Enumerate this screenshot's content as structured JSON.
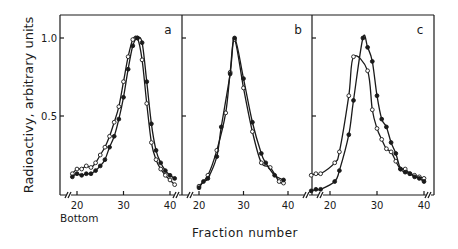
{
  "chart_data": {
    "type": "line",
    "title": "",
    "ylabel": "Radioactivy, arbitrary units",
    "xlabel": "Fraction number",
    "x_note": "Bottom",
    "ylim": [
      0,
      1.1
    ],
    "yticks": [
      0.5,
      1.0
    ],
    "ytick_labels": [
      "0.5",
      "1.0"
    ],
    "grid": false,
    "legend": "none",
    "panels": [
      {
        "label": "a",
        "xlim": [
          17,
          42
        ],
        "xticks": [
          20,
          30,
          40
        ],
        "xtick_labels": [
          "20",
          "30",
          "40"
        ],
        "series": [
          {
            "name": "open circles",
            "marker": "open-circle",
            "x": [
              19,
              20,
              21,
              22,
              23,
              24,
              25,
              26,
              27,
              28,
              29,
              30,
              31,
              32,
              33,
              34,
              35,
              36,
              37,
              38,
              39,
              40,
              41
            ],
            "y": [
              0.13,
              0.16,
              0.16,
              0.18,
              0.17,
              0.2,
              0.25,
              0.3,
              0.37,
              0.46,
              0.56,
              0.72,
              0.88,
              0.99,
              1.0,
              0.86,
              0.58,
              0.33,
              0.22,
              0.16,
              0.12,
              0.09,
              0.06
            ]
          },
          {
            "name": "filled circles",
            "marker": "filled-circle",
            "x": [
              19,
              20,
              21,
              22,
              23,
              24,
              25,
              26,
              27,
              28,
              29,
              30,
              31,
              32,
              33,
              34,
              35,
              36,
              37,
              38,
              39,
              40,
              41
            ],
            "y": [
              0.11,
              0.13,
              0.12,
              0.13,
              0.13,
              0.15,
              0.18,
              0.22,
              0.3,
              0.37,
              0.48,
              0.62,
              0.8,
              0.95,
              1.0,
              0.97,
              0.72,
              0.45,
              0.28,
              0.2,
              0.15,
              0.12,
              0.1
            ]
          }
        ]
      },
      {
        "label": "b",
        "xlim": [
          16,
          42
        ],
        "xticks": [
          20,
          30,
          40
        ],
        "xtick_labels": [
          "20",
          "30",
          "40"
        ],
        "series": [
          {
            "name": "open circles",
            "marker": "open-circle",
            "x": [
              20,
              22,
              24,
              26,
              27,
              28,
              30,
              32,
              34,
              36,
              38,
              39
            ],
            "y": [
              0.05,
              0.12,
              0.28,
              0.52,
              0.78,
              0.99,
              0.68,
              0.4,
              0.2,
              0.17,
              0.08,
              0.07
            ],
            "note": "curve shifted slightly left"
          },
          {
            "name": "filled circles",
            "marker": "filled-circle",
            "x": [
              20,
              21,
              22,
              24,
              25,
              27,
              28,
              30,
              32,
              34,
              35,
              37,
              39
            ],
            "y": [
              0.04,
              0.08,
              0.1,
              0.24,
              0.43,
              0.77,
              1.0,
              0.74,
              0.46,
              0.26,
              0.2,
              0.12,
              0.09
            ]
          }
        ]
      },
      {
        "label": "c",
        "xlim": [
          16,
          42
        ],
        "xticks": [
          20,
          30,
          40
        ],
        "xtick_labels": [
          "20",
          "30",
          "40"
        ],
        "series": [
          {
            "name": "open circles",
            "marker": "open-circle",
            "x": [
              16,
              17,
              18,
              21,
              22,
              24,
              25,
              28,
              29,
              30,
              31,
              32,
              33,
              34,
              35,
              36,
              37,
              38,
              39,
              40
            ],
            "y": [
              0.12,
              0.13,
              0.13,
              0.2,
              0.27,
              0.63,
              0.88,
              0.79,
              0.54,
              0.42,
              0.35,
              0.29,
              0.27,
              0.21,
              0.16,
              0.16,
              0.13,
              0.12,
              0.11,
              0.1
            ]
          },
          {
            "name": "filled circles",
            "marker": "filled-circle",
            "x": [
              16,
              17,
              18,
              21,
              22,
              24,
              25,
              27,
              28,
              29,
              30,
              31,
              32,
              33,
              34,
              35,
              36,
              37,
              38,
              39,
              40
            ],
            "y": [
              0.02,
              0.03,
              0.03,
              0.08,
              0.15,
              0.38,
              0.6,
              1.0,
              0.94,
              0.85,
              0.63,
              0.48,
              0.43,
              0.33,
              0.26,
              0.16,
              0.14,
              0.13,
              0.11,
              0.1,
              0.08
            ]
          }
        ]
      }
    ]
  },
  "layout": {
    "plot_top": 15,
    "plot_bottom": 195,
    "y_one_px": 38,
    "y_zero_px": 194,
    "panels_px": [
      {
        "left": 60,
        "right": 182,
        "x20": 77,
        "x40": 170
      },
      {
        "left": 182,
        "right": 312,
        "x20": 199,
        "x40": 288
      },
      {
        "left": 312,
        "right": 434,
        "x20": 330,
        "x40": 424
      }
    ]
  }
}
